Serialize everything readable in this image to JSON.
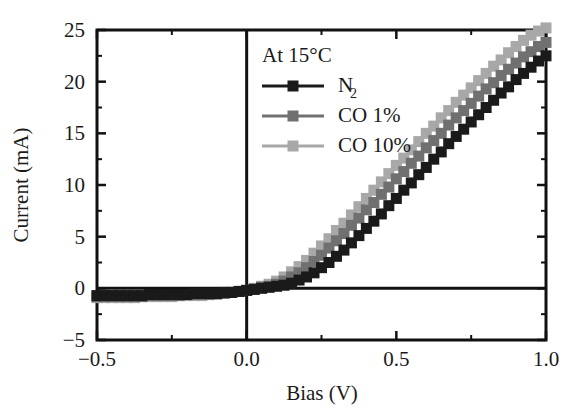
{
  "chart_data": {
    "type": "line",
    "title": "",
    "annotation": "At 15°C",
    "xlabel": "Bias (V)",
    "ylabel": "Current (mA)",
    "xlim": [
      -0.5,
      1.0
    ],
    "ylim": [
      -5,
      25
    ],
    "xticks": [
      -0.5,
      0.0,
      0.5,
      1.0
    ],
    "xtick_labels": [
      "−0.5",
      "0.0",
      "0.5",
      "1.0"
    ],
    "yticks": [
      -5,
      0,
      5,
      10,
      15,
      20,
      25
    ],
    "ytick_labels": [
      "−5",
      "0",
      "5",
      "10",
      "15",
      "20",
      "25"
    ],
    "x_minor_ticks": [
      -0.25,
      0.25,
      0.75
    ],
    "y_minor_ticks": [
      -2.5,
      2.5,
      7.5,
      12.5,
      17.5,
      22.5
    ],
    "grid": false,
    "legend_position": "upper-left-inside",
    "marker": "square",
    "zero_line_x": 0.0,
    "zero_line_y": 0,
    "x": [
      -0.5,
      -0.475,
      -0.45,
      -0.425,
      -0.4,
      -0.375,
      -0.35,
      -0.325,
      -0.3,
      -0.275,
      -0.25,
      -0.225,
      -0.2,
      -0.175,
      -0.15,
      -0.125,
      -0.1,
      -0.075,
      -0.05,
      -0.025,
      0.0,
      0.025,
      0.05,
      0.075,
      0.1,
      0.125,
      0.15,
      0.175,
      0.2,
      0.225,
      0.25,
      0.275,
      0.3,
      0.325,
      0.35,
      0.375,
      0.4,
      0.425,
      0.45,
      0.475,
      0.5,
      0.525,
      0.55,
      0.575,
      0.6,
      0.625,
      0.65,
      0.675,
      0.7,
      0.725,
      0.75,
      0.775,
      0.8,
      0.825,
      0.85,
      0.875,
      0.9,
      0.925,
      0.95,
      0.975,
      1.0
    ],
    "series": [
      {
        "name": "N₂",
        "color": "#1a1a1a",
        "line_color": "#1a1a1a",
        "values": [
          -0.7,
          -0.7,
          -0.7,
          -0.7,
          -0.7,
          -0.7,
          -0.7,
          -0.6,
          -0.6,
          -0.6,
          -0.6,
          -0.6,
          -0.6,
          -0.5,
          -0.5,
          -0.5,
          -0.5,
          -0.4,
          -0.4,
          -0.3,
          -0.2,
          -0.1,
          0.0,
          0.1,
          0.2,
          0.3,
          0.5,
          0.8,
          1.1,
          1.5,
          2.0,
          2.5,
          3.1,
          3.7,
          4.4,
          5.1,
          5.8,
          6.5,
          7.2,
          8.0,
          8.7,
          9.5,
          10.2,
          11.0,
          11.7,
          12.5,
          13.2,
          14.0,
          14.7,
          15.4,
          16.1,
          16.8,
          17.5,
          18.2,
          18.9,
          19.5,
          20.2,
          20.8,
          21.4,
          22.0,
          22.5
        ]
      },
      {
        "name": "CO 1%",
        "color": "#707070",
        "line_color": "#707070",
        "values": [
          -0.8,
          -0.8,
          -0.8,
          -0.8,
          -0.8,
          -0.8,
          -0.8,
          -0.7,
          -0.7,
          -0.7,
          -0.7,
          -0.7,
          -0.6,
          -0.6,
          -0.6,
          -0.6,
          -0.5,
          -0.5,
          -0.4,
          -0.3,
          -0.2,
          -0.1,
          0.1,
          0.2,
          0.4,
          0.7,
          1.1,
          1.5,
          2.0,
          2.6,
          3.2,
          3.9,
          4.6,
          5.3,
          6.1,
          6.8,
          7.6,
          8.3,
          9.1,
          9.8,
          10.6,
          11.3,
          12.1,
          12.8,
          13.6,
          14.3,
          15.0,
          15.8,
          16.5,
          17.2,
          17.9,
          18.6,
          19.3,
          19.9,
          20.6,
          21.2,
          21.8,
          22.4,
          22.9,
          23.4,
          23.8
        ]
      },
      {
        "name": "CO 10%",
        "color": "#a8a8a8",
        "line_color": "#a8a8a8",
        "values": [
          -0.9,
          -0.9,
          -0.9,
          -0.9,
          -0.9,
          -0.9,
          -0.8,
          -0.8,
          -0.8,
          -0.8,
          -0.8,
          -0.7,
          -0.7,
          -0.7,
          -0.7,
          -0.6,
          -0.6,
          -0.5,
          -0.4,
          -0.3,
          -0.2,
          0.0,
          0.2,
          0.4,
          0.7,
          1.1,
          1.6,
          2.1,
          2.7,
          3.4,
          4.1,
          4.8,
          5.6,
          6.3,
          7.1,
          7.9,
          8.7,
          9.5,
          10.3,
          11.1,
          11.9,
          12.6,
          13.4,
          14.2,
          15.0,
          15.7,
          16.5,
          17.2,
          18.0,
          18.7,
          19.4,
          20.1,
          20.8,
          21.5,
          22.1,
          22.8,
          23.4,
          24.0,
          24.5,
          24.9,
          25.2
        ]
      }
    ]
  },
  "legend": {
    "annotation": "At 15°C",
    "entries": [
      {
        "label": "N",
        "sub": "2",
        "color": "#1a1a1a"
      },
      {
        "label": "CO 1%",
        "sub": "",
        "color": "#707070"
      },
      {
        "label": "CO 10%",
        "sub": "",
        "color": "#a8a8a8"
      }
    ]
  },
  "axes": {
    "x_title": "Bias (V)",
    "y_title": "Current (mA)",
    "x_labels": [
      "−0.5",
      "0.0",
      "0.5",
      "1.0"
    ],
    "y_labels": [
      "−5",
      "0",
      "5",
      "10",
      "15",
      "20",
      "25"
    ]
  }
}
